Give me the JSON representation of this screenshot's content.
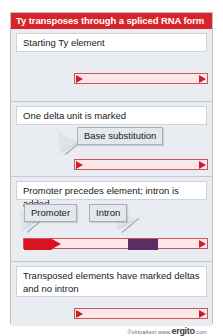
{
  "title": "Ty transposes through a spliced RNA form",
  "colors": {
    "title_bar": "#d8232a",
    "panel_bg": "#e9edf2",
    "caption_bg": "#ffffff",
    "bar_fill": "#fbe7e9",
    "bar_border": "#c9555f",
    "delta_arrow": "#cc1f28",
    "promoter": "#d81420",
    "intron": "#5b2d63",
    "callout_bg": "#e4e7ec"
  },
  "panels": [
    {
      "caption": "Starting Ty element",
      "callouts": []
    },
    {
      "caption": "One delta unit is marked",
      "callouts": [
        {
          "label": "Base substitution"
        }
      ]
    },
    {
      "caption": "Promoter precedes element; intron is added",
      "callouts": [
        {
          "label": "Promoter"
        },
        {
          "label": "Intron"
        }
      ]
    },
    {
      "caption": "Transposed elements have marked deltas and no intron",
      "callouts": []
    }
  ],
  "footer": {
    "copyright": "©virtualtext",
    "www": "www.",
    "brand": "ergito",
    "tld": ".com"
  }
}
